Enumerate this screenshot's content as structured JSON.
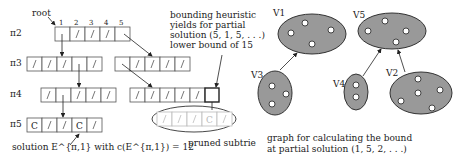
{
  "trie": {
    "root_label": "root",
    "column_numbers": [
      "1",
      "2",
      "3",
      "4",
      "5"
    ],
    "row_labels": [
      "π2",
      "π3",
      "π4",
      "π5"
    ],
    "annotation": [
      "bounding heuristic",
      "yields for partial",
      "solution (5, 1, 5, . . .)",
      "lower bound of 15"
    ],
    "solution_label": "solution E^{π,1} with c(E^{π,1}) = 12",
    "pruned_label": "pruned subtrie",
    "cells": {
      "pi2": [
        "",
        "/",
        "/",
        "/",
        ""
      ],
      "pi3_left": [
        "/",
        "/",
        "/",
        "",
        "/"
      ],
      "pi3_right": [
        "",
        "/",
        "/",
        "/",
        "/"
      ],
      "pi4_left": [
        "/",
        "",
        "/",
        "/",
        "/"
      ],
      "pi4_right": [
        "/",
        "/",
        "/",
        "/",
        "/",
        ""
      ],
      "pi5": [
        "C",
        "/",
        "/",
        "C",
        "/"
      ],
      "pruned": [
        "/",
        "/",
        "/",
        "C",
        "/"
      ]
    }
  },
  "graph": {
    "nodes": [
      {
        "label": "V1",
        "dots": 4
      },
      {
        "label": "V5",
        "dots": 4
      },
      {
        "label": "V3",
        "dots": 3
      },
      {
        "label": "V4",
        "dots": 2
      },
      {
        "label": "V2",
        "dots": 5
      }
    ],
    "caption": [
      "graph for calculating the bound",
      "at partial solution (1, 5, 2, . . .)"
    ]
  }
}
